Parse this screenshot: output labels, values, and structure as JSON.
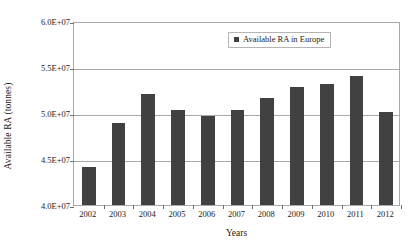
{
  "chart_data": {
    "type": "bar",
    "title": "",
    "xlabel": "Years",
    "ylabel": "Available RA (tonnes)",
    "categories": [
      "2002",
      "2003",
      "2004",
      "2005",
      "2006",
      "2007",
      "2008",
      "2009",
      "2010",
      "2011",
      "2012"
    ],
    "values": [
      44100000,
      48900000,
      52100000,
      50300000,
      49700000,
      50300000,
      51600000,
      52800000,
      53100000,
      54000000,
      50100000
    ],
    "series": [
      {
        "name": "Available RA in Europe",
        "values": [
          44100000,
          48900000,
          52100000,
          50300000,
          49700000,
          50300000,
          51600000,
          52800000,
          53100000,
          54000000,
          50100000
        ]
      }
    ],
    "ylim": [
      40000000,
      60000000
    ],
    "ytick_values": [
      40000000,
      45000000,
      50000000,
      55000000,
      60000000
    ],
    "ytick_labels": [
      "4.0E+07",
      "4.5E+07",
      "5.0E+07",
      "5.5E+07",
      "6.0E+07"
    ],
    "grid": true,
    "grid_axis": "y",
    "legend_position": "top-right",
    "legend_entries": [
      "Available RA in Europe"
    ],
    "bar_color": "#414141",
    "axis_color": "#a9a9a9",
    "background_color": "#ffffff"
  },
  "legend": {
    "entry_label": "Available RA in Europe"
  },
  "axes": {
    "y_title": "Available RA (tonnes)",
    "x_title": "Years"
  }
}
